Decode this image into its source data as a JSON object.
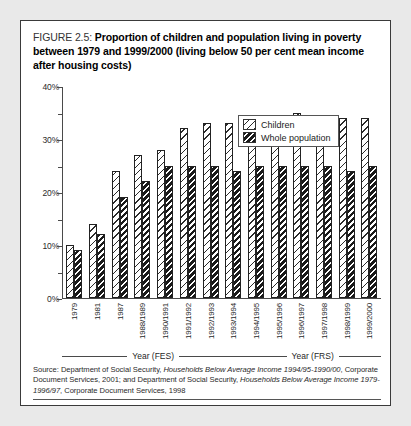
{
  "figure": {
    "label": "FIGURE 2.5:",
    "title": "Proportion of children and population living in poverty between 1979 and 1999/2000 (living below 50 per cent mean income after housing costs)",
    "source_part1": "Source: Department of Social Security, ",
    "source_italic1": "Households Below Average Income 1994/95-1990/00",
    "source_part2": ", Corporate Document Services, 2001; and Department of Social Security, ",
    "source_italic2": "Households Below Average Income 1979-1996/97",
    "source_part3": ", Corporate Document Services, 1998"
  },
  "legend": {
    "items": [
      {
        "label": "Children",
        "pattern": "sparse-diagonal-hatch"
      },
      {
        "label": "Whole population",
        "pattern": "dense-diagonal-hatch"
      }
    ]
  },
  "axis": {
    "y_ticks": [
      "0%",
      "10%",
      "20%",
      "30%",
      "40%"
    ],
    "groups": [
      {
        "label": "Year (FES)",
        "count": 8
      },
      {
        "label": "Year (FRS)",
        "count": 6
      }
    ]
  },
  "chart_data": {
    "type": "bar",
    "title": "Proportion of children and population living in poverty between 1979 and 1999/2000 (living below 50 per cent mean income after housing costs)",
    "xlabel": "Year",
    "ylabel": "",
    "ylim": [
      0,
      40
    ],
    "ytick_values": [
      0,
      10,
      20,
      30,
      40
    ],
    "ytick_labels": [
      "0%",
      "10%",
      "20%",
      "30%",
      "40%"
    ],
    "grid": false,
    "legend_position": "top-right",
    "categories": [
      "1979",
      "1981",
      "1987",
      "1988/1989",
      "1990/1991",
      "1991/1992",
      "1992/1993",
      "1993/1994",
      "1994/1995",
      "1995/1996",
      "1996/1997",
      "1997/1998",
      "1998/1999",
      "1999/2000"
    ],
    "series": [
      {
        "name": "Children",
        "values": [
          10,
          14,
          24,
          27,
          28,
          32,
          33,
          33,
          33,
          34,
          35,
          34,
          34,
          34
        ]
      },
      {
        "name": "Whole population",
        "values": [
          9,
          12,
          19,
          22,
          25,
          25,
          25,
          24,
          25,
          25,
          25,
          25,
          24,
          25
        ]
      }
    ]
  }
}
